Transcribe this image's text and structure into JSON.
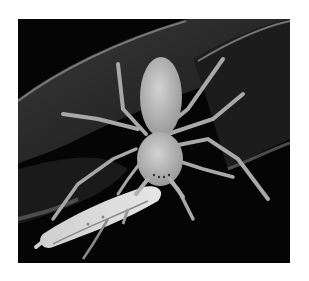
{
  "image": {
    "alt": "Grayscale close-up photograph of a huntsman-type spider on a leaf at night, holding a pale cricket-like insect prey",
    "subject": "spider-eating-prey",
    "style": "black-and-white macro photograph",
    "colors": {
      "page_background": "#ffffff",
      "photo_background": "#050505",
      "leaf": "#2a2a2a",
      "leaf_edge": "#8a8a8a",
      "spider_body": "#bdbdbd",
      "spider_legs": "#a8a8a8",
      "prey": "#d6d6d6"
    }
  }
}
